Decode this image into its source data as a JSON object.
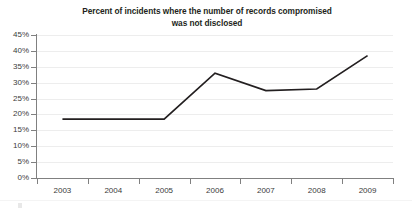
{
  "chart_data": {
    "type": "line",
    "title": "Percent of incidents where the number of records compromised was not disclosed",
    "title_lines": [
      "Percent of incidents where the number of records compromised",
      "was not disclosed"
    ],
    "xlabel": "",
    "ylabel": "",
    "categories": [
      "2003",
      "2004",
      "2005",
      "2006",
      "2007",
      "2008",
      "2009"
    ],
    "values": [
      18.5,
      18.5,
      18.5,
      33.0,
      27.5,
      28.0,
      38.5
    ],
    "series": [
      {
        "name": "Percent of incidents not disclosed",
        "values": [
          18.5,
          18.5,
          18.5,
          33.0,
          27.5,
          28.0,
          38.5
        ]
      }
    ],
    "ylim": [
      0,
      45
    ],
    "ytick_values": [
      0,
      5,
      10,
      15,
      20,
      25,
      30,
      35,
      40,
      45
    ],
    "ytick_labels": [
      "0%",
      "5%",
      "10%",
      "15%",
      "20%",
      "25%",
      "30%",
      "35%",
      "40%",
      "45%"
    ],
    "grid": true,
    "grid_axis": "y",
    "legend": false,
    "legend_position": "none",
    "markers": false,
    "line_color": "#231f20",
    "grid_color": "#ededed",
    "axis_color": "#808080",
    "background_color": "#ffffff",
    "text_color": "#231f20"
  }
}
